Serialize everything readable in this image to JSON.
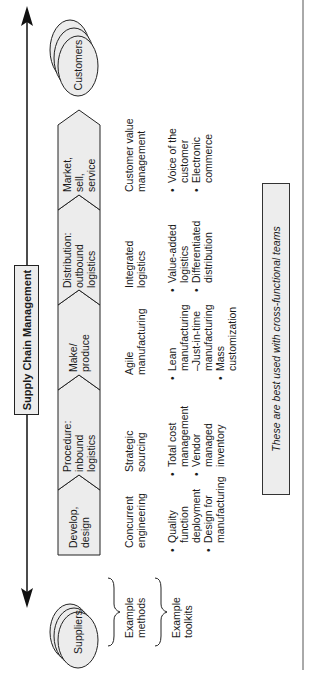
{
  "title": "Supply Chain Management",
  "endpoints": {
    "start": "Suppliers",
    "end": "Customers"
  },
  "process_steps": [
    {
      "label": "Develop, design",
      "lines": [
        "Develop,",
        "design"
      ]
    },
    {
      "label": "Procedure: inbound logistics",
      "lines": [
        "Procedure:",
        "inbound",
        "logistics"
      ]
    },
    {
      "label": "Make/ produce",
      "lines": [
        "Make/",
        "produce"
      ]
    },
    {
      "label": "Distribution: outbound logistics",
      "lines": [
        "Distribution:",
        "outbound",
        "logistics"
      ]
    },
    {
      "label": "Market, sell, service",
      "lines": [
        "Market,",
        "sell,",
        "service"
      ]
    }
  ],
  "row_labels": {
    "methods": [
      "Example",
      "methods"
    ],
    "toolkits": [
      "Example",
      "toolkits"
    ]
  },
  "methods": [
    [
      "Concurrent",
      "engineering"
    ],
    [
      "Strategic",
      "sourcing"
    ],
    [
      "Agile",
      "manufacturing"
    ],
    [
      "Integrated",
      "logistics"
    ],
    [
      "Customer value",
      "management"
    ]
  ],
  "toolkits": [
    [
      [
        "Quality",
        "function",
        "deployment"
      ],
      [
        "Design for",
        "manufacturing"
      ]
    ],
    [
      [
        "Total cost",
        "management"
      ],
      [
        "Vendor",
        "managed",
        "inventory"
      ]
    ],
    [
      [
        "Lean",
        "manufacturing",
        "–Just-in-time",
        "manufacturing"
      ],
      [
        "Mass",
        "customization"
      ]
    ],
    [
      [
        "Value-added",
        "logistics"
      ],
      [
        "Differentiated",
        "distribution"
      ]
    ],
    [
      [
        "Voice of the",
        "customer"
      ],
      [
        "Electronic",
        "commerce"
      ]
    ]
  ],
  "note": "These are best used with cross-functional teams",
  "colors": {
    "shape_fill": "#ececec",
    "stroke": "#222222",
    "text": "#1a1a1a"
  }
}
